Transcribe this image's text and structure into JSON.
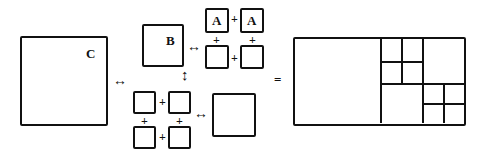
{
  "diagram": {
    "labels": {
      "big": "C",
      "medium": "B",
      "small_a1": "A",
      "small_a2": "A"
    },
    "symbols": {
      "plus": "+",
      "equals": "=",
      "lr_arrow": "↔",
      "ud_arrow": "↕"
    }
  }
}
